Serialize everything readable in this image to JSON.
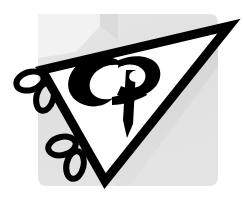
{
  "image": {
    "kind": "logo-mark",
    "width": 243,
    "height": 206,
    "alt_text": "Stylized CP monogram inside a downward-pointing outlined triangle with decorative ribbon loops, on a light gray panel",
    "background_color": "#ffffff"
  },
  "backdrop": {
    "name": "gray-panel",
    "fill_color": "#e2e2e2",
    "highlight_color": "#eeeeee",
    "corner_radius": 8,
    "bounds": {
      "x": 38,
      "y": 14,
      "width": 180,
      "height": 172
    }
  },
  "shadow": {
    "name": "triangle-drop-shadow",
    "color": "#cfcfcf",
    "opacity": 0.85
  },
  "triangle": {
    "name": "outlined-triangle",
    "stroke_color": "#000000",
    "fill_color": "#ffffff",
    "stroke_width": 9,
    "vertices": [
      {
        "label": "left",
        "x": 42,
        "y": 70
      },
      {
        "label": "right",
        "x": 229,
        "y": 26
      },
      {
        "label": "bottom",
        "x": 105,
        "y": 181
      }
    ]
  },
  "monogram": {
    "name": "cp-monogram",
    "letters": "CP",
    "color": "#000000",
    "counter_color": "#ffffff",
    "style": "brush-script-swash"
  },
  "ornaments": {
    "name": "ribbon-loops",
    "color": "#000000",
    "stroke_width": 6,
    "loops": [
      {
        "group": "upper",
        "cx": 30,
        "cy": 80,
        "rx": 14,
        "ry": 9,
        "rotation": -18
      },
      {
        "group": "upper",
        "cx": 44,
        "cy": 96,
        "rx": 8,
        "ry": 14,
        "rotation": 14
      },
      {
        "group": "lower",
        "cx": 62,
        "cy": 146,
        "rx": 14,
        "ry": 9,
        "rotation": -14
      },
      {
        "group": "lower",
        "cx": 74,
        "cy": 165,
        "rx": 8,
        "ry": 14,
        "rotation": 12
      }
    ]
  },
  "palette": {
    "ink": "#000000",
    "paper": "#ffffff",
    "panel": "#e2e2e2",
    "panel_light": "#efefef",
    "shade": "#cccccc"
  }
}
